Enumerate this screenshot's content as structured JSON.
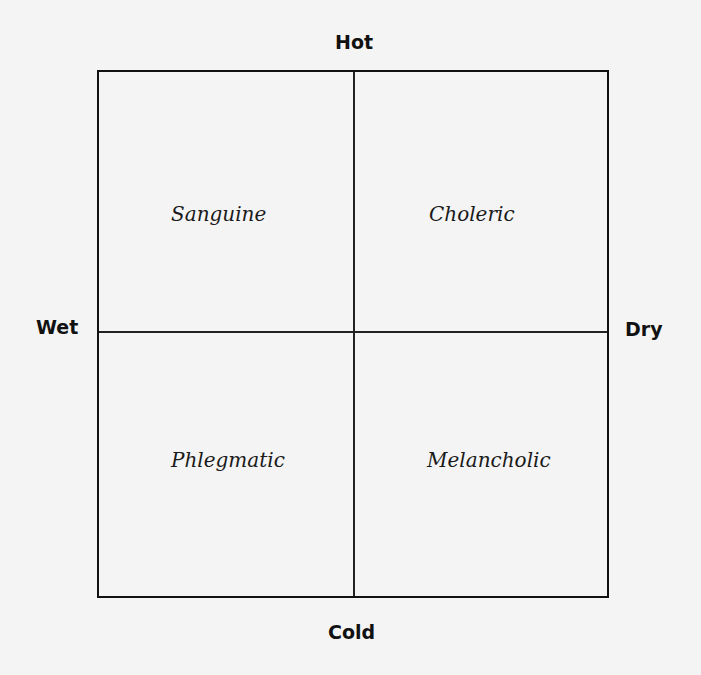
{
  "diagram": {
    "axes": {
      "top": "Hot",
      "bottom": "Cold",
      "left": "Wet",
      "right": "Dry"
    },
    "quadrants": {
      "top_left": "Sanguine",
      "top_right": "Choleric",
      "bottom_left": "Phlegmatic",
      "bottom_right": "Melancholic"
    }
  }
}
